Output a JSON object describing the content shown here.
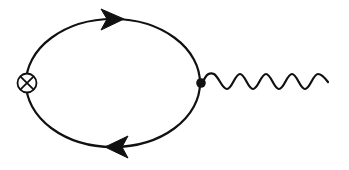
{
  "diagram": {
    "type": "feynman-diagram",
    "description": "One-loop fermion loop with an operator insertion (crossed circle) and a vertex emitting a wavy boson line",
    "colors": {
      "line": "#111111",
      "background": "#ffffff"
    },
    "loop": {
      "shape": "ellipse",
      "center": [
        113,
        83
      ],
      "rx": 87,
      "ry": 64,
      "line_type": "solid-fermion"
    },
    "arrows": [
      {
        "position": "top",
        "direction": "right",
        "at": [
          113,
          19
        ]
      },
      {
        "position": "bottom",
        "direction": "left",
        "at": [
          117,
          147
        ]
      }
    ],
    "insertion": {
      "symbol": "otimes",
      "name": "crossed-circle-insertion",
      "center": [
        27,
        83
      ],
      "radius": 9
    },
    "vertex": {
      "name": "filled-vertex-dot",
      "center": [
        201,
        83
      ],
      "radius": 4.5
    },
    "boson_line": {
      "line_type": "wavy",
      "start": [
        202,
        81
      ],
      "end": [
        328,
        80
      ],
      "periods": 5,
      "amplitude": 8
    },
    "labels": []
  }
}
